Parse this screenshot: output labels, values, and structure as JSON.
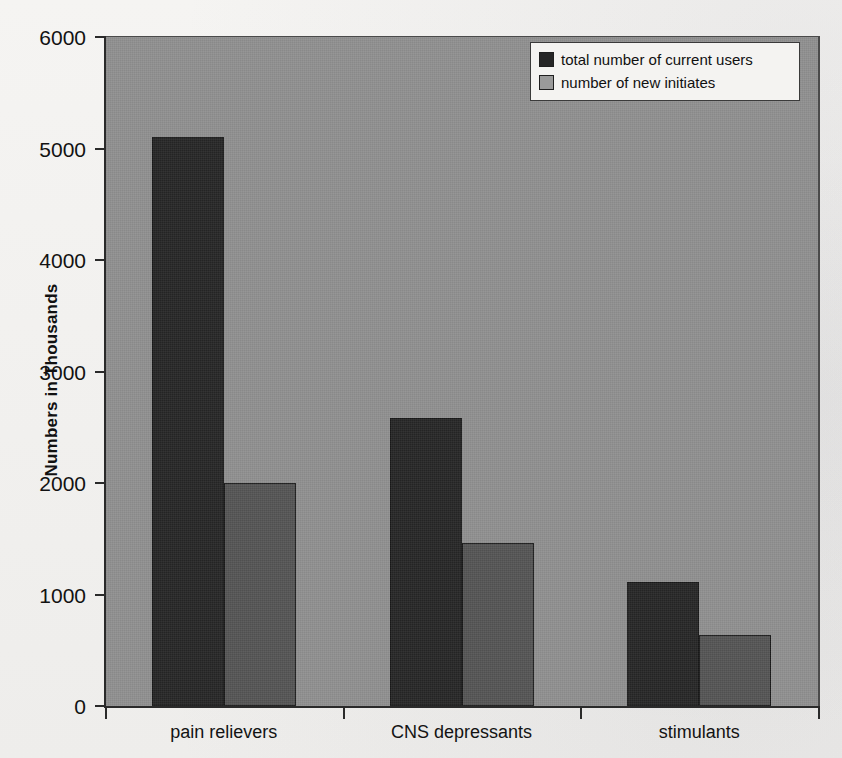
{
  "chart_data": {
    "type": "bar",
    "title": "",
    "xlabel": "",
    "ylabel": "Numbers in Thousands",
    "categories": [
      "pain relievers",
      "CNS depressants",
      "stimulants"
    ],
    "series": [
      {
        "name": "total number of current users",
        "color": "#262626",
        "values": [
          5100,
          2580,
          1110
        ]
      },
      {
        "name": "number of new initiates",
        "color": "#545454",
        "values": [
          2000,
          1460,
          640
        ]
      }
    ],
    "ylim": [
      0,
      6000
    ],
    "ytick_labels": [
      "0",
      "1000",
      "2000",
      "3000",
      "4000",
      "5000",
      "6000"
    ],
    "ytick_values": [
      0,
      1000,
      2000,
      3000,
      4000,
      5000,
      6000
    ],
    "grid": false,
    "legend_position": "top-right",
    "plot_background": "#8f8f8f",
    "figure_background": "#f2f1ef",
    "axis_color": "#2a2a2a"
  },
  "legend": {
    "items": [
      {
        "label": "total number of current users",
        "swatch": "#262626"
      },
      {
        "label": "number of new initiates",
        "swatch": "#9a9a9a"
      }
    ]
  }
}
